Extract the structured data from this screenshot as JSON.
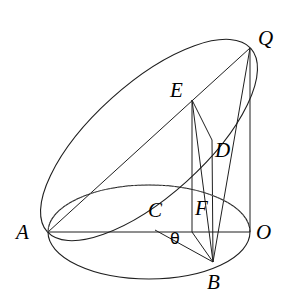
{
  "figure": {
    "type": "geometry-diagram",
    "width": 297,
    "height": 307,
    "background_color": "#ffffff",
    "stroke_color": "#1a1a1a"
  },
  "labels": [
    {
      "id": "Q",
      "text": "Q",
      "x": 258,
      "y": 28
    },
    {
      "id": "E",
      "text": "E",
      "x": 170,
      "y": 80
    },
    {
      "id": "D",
      "text": "D",
      "x": 215,
      "y": 140
    },
    {
      "id": "F",
      "text": "F",
      "x": 195,
      "y": 198
    },
    {
      "id": "C",
      "text": "C",
      "x": 148,
      "y": 200
    },
    {
      "id": "theta",
      "text": "θ",
      "x": 170,
      "y": 231
    },
    {
      "id": "A",
      "text": "A",
      "x": 16,
      "y": 222
    },
    {
      "id": "O",
      "text": "O",
      "x": 256,
      "y": 222
    },
    {
      "id": "B",
      "text": "B",
      "x": 207,
      "y": 272
    }
  ],
  "points": {
    "A": {
      "x": 48,
      "y": 232
    },
    "O": {
      "x": 250,
      "y": 232
    },
    "Q": {
      "x": 250,
      "y": 48
    },
    "B": {
      "x": 213,
      "y": 262
    },
    "C": {
      "x": 155,
      "y": 230
    },
    "D": {
      "x": 212,
      "y": 140
    },
    "E": {
      "x": 192,
      "y": 100
    },
    "F": {
      "x": 192,
      "y": 232
    }
  },
  "shapes": {
    "base_ellipse": {
      "cx": 149,
      "cy": 232,
      "rx": 101,
      "ry": 47
    },
    "tilted_ellipse": {
      "cx": 149,
      "cy": 140,
      "rx": 137,
      "ry": 56,
      "rotation_deg": -42
    }
  },
  "segments": [
    {
      "name": "A-O",
      "from": "A",
      "to": "O",
      "style": "solid"
    },
    {
      "name": "Q-O",
      "from": "Q",
      "to": "O",
      "style": "solid"
    },
    {
      "name": "E-F",
      "from": "E",
      "to": "F",
      "style": "solid"
    },
    {
      "name": "E-D",
      "from": "E",
      "to": "D",
      "style": "solid"
    },
    {
      "name": "E-B",
      "from": "E",
      "to": "B",
      "style": "solid"
    },
    {
      "name": "D-B",
      "from": "D",
      "to": "B",
      "style": "solid"
    },
    {
      "name": "C-B",
      "from": "C",
      "to": "B",
      "style": "solid"
    },
    {
      "name": "F-B",
      "from": "F",
      "to": "B",
      "style": "solid"
    },
    {
      "name": "A-Q",
      "from": "A",
      "to": "Q",
      "style": "solid"
    },
    {
      "name": "B-Q",
      "from": "B",
      "to": "Q",
      "style": "solid"
    }
  ],
  "angle_marks": [
    {
      "name": "theta-at-C",
      "vertex": "C",
      "between": [
        "C-O",
        "C-B"
      ],
      "label": "θ"
    }
  ]
}
